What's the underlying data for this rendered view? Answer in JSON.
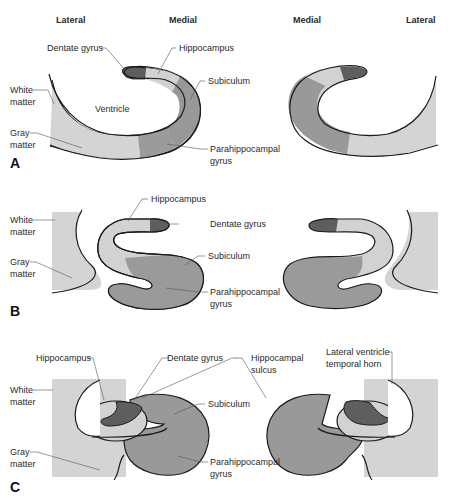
{
  "headers": {
    "left_lateral": "Lateral",
    "left_medial": "Medial",
    "right_medial": "Medial",
    "right_lateral": "Lateral"
  },
  "panels": {
    "a": {
      "letter": "A",
      "labels": {
        "dentate_gyrus": "Dentate gyrus",
        "hippocampus": "Hippocampus",
        "subiculum": "Subiculum",
        "white_matter_1": "White",
        "white_matter_2": "matter",
        "ventricle": "Ventricle",
        "gray_matter_1": "Gray",
        "gray_matter_2": "matter",
        "parahippocampal_1": "Parahippocampal",
        "parahippocampal_2": "gyrus"
      }
    },
    "b": {
      "letter": "B",
      "labels": {
        "hippocampus": "Hippocampus",
        "dentate_gyrus": "Dentate gyrus",
        "white_matter_1": "White",
        "white_matter_2": "matter",
        "subiculum": "Subiculum",
        "gray_matter_1": "Gray",
        "gray_matter_2": "matter",
        "parahippocampal_1": "Parahippocampal",
        "parahippocampal_2": "gyrus"
      }
    },
    "c": {
      "letter": "C",
      "labels": {
        "hippocampus": "Hippocampus",
        "dentate_gyrus": "Dentate gyrus",
        "hippocampal_sulcus_1": "Hippocampal",
        "hippocampal_sulcus_2": "sulcus",
        "lateral_ventricle_1": "Lateral ventricle",
        "lateral_ventricle_2": "temporal horn",
        "white_matter_1": "White",
        "white_matter_2": "matter",
        "subiculum": "Subiculum",
        "gray_matter_1": "Gray",
        "gray_matter_2": "matter",
        "parahippocampal_1": "Parahippocampal",
        "parahippocampal_2": "gyrus"
      }
    }
  },
  "colors": {
    "dentate": "#5e5e5e",
    "hippocampus": "#d2d2d2",
    "subiculum": "#989898",
    "parahippocampal": "#9a9a9a",
    "gray_matter": "#cfcfcf",
    "white_matter": "#dcdcdc",
    "outline": "#1a1a1a",
    "leader": "#555555"
  }
}
